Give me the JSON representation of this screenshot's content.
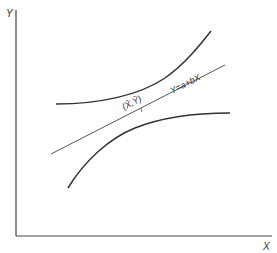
{
  "diagram": {
    "type": "regression-confidence-band",
    "axes": {
      "x_label": "X",
      "y_label": "Y"
    },
    "regression_line": {
      "equation_label": "Y=a+bX",
      "mean_point_label": "(X̄,Ȳ)"
    },
    "curves": [
      "upper-confidence-curve",
      "lower-confidence-curve"
    ],
    "colors": {
      "axis": "#444444",
      "curve": "#333333",
      "line": "#555555"
    }
  }
}
